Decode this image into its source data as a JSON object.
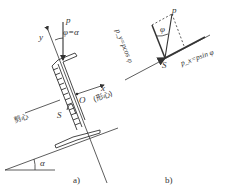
{
  "figure_a": {
    "force_label": "p",
    "angle_label": "φ=α",
    "y_axis_label": "y",
    "x_axis_label": "x",
    "centroid_label": "O",
    "centroid_note": "(形心)",
    "shear_center_note": "剪心",
    "shear_center_label": "S",
    "slope_angle_label": "α",
    "caption": "a)"
  },
  "figure_b": {
    "force_label": "p",
    "angle_label": "φ",
    "py_label": "p_y=pcos φ",
    "px_label": "p_x=psin φ",
    "shear_center_label": "S",
    "caption": "b)"
  },
  "colors": {
    "line": "#333333",
    "background": "#ffffff"
  }
}
